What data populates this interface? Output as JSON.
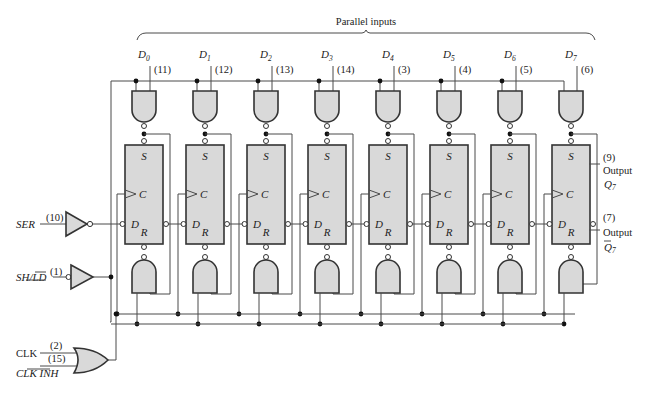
{
  "title": "Parallel inputs",
  "stages": [
    {
      "name": "D",
      "sub": "0",
      "pin": "(11)"
    },
    {
      "name": "D",
      "sub": "1",
      "pin": "(12)"
    },
    {
      "name": "D",
      "sub": "2",
      "pin": "(13)"
    },
    {
      "name": "D",
      "sub": "3",
      "pin": "(14)"
    },
    {
      "name": "D",
      "sub": "4",
      "pin": "(3)"
    },
    {
      "name": "D",
      "sub": "5",
      "pin": "(4)"
    },
    {
      "name": "D",
      "sub": "6",
      "pin": "(5)"
    },
    {
      "name": "D",
      "sub": "7",
      "pin": "(6)"
    }
  ],
  "ff_labels": {
    "s": "S",
    "c": "C",
    "d": "D",
    "r": "R"
  },
  "inputs": {
    "ser": {
      "label": "SER",
      "pin": "(10)"
    },
    "shld": {
      "label": "SH/LD",
      "pin": "(1)"
    },
    "clk": {
      "label": "CLK",
      "pin": "(2)"
    },
    "clkinh": {
      "label": "CLK INH",
      "pin": "(15)"
    }
  },
  "outputs": {
    "q7": {
      "pin": "(9)",
      "label": "Output",
      "sym": "Q",
      "sub": "7"
    },
    "q7bar": {
      "pin": "(7)",
      "label": "Output",
      "sym": "Q",
      "sub": "7"
    }
  }
}
